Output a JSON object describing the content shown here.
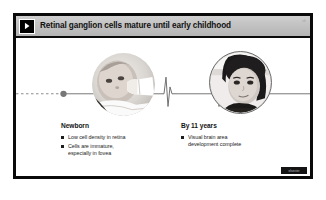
{
  "slide": {
    "header": {
      "icon": "play-chevron-icon",
      "title": "Retinal ganglion cells mature until early childhood",
      "corner_code": "ch"
    },
    "photos": [
      {
        "name": "newborn-photo",
        "alt": "Newborn baby feeding from a bottle"
      },
      {
        "name": "child-photo",
        "alt": "Young child portrait"
      }
    ],
    "timeline": {
      "left_marker": "timeline-dot-newborn",
      "right_marker": "timeline-dot-child",
      "spike_left": "timeline-spike-left",
      "spike_right": "timeline-spike-right"
    },
    "blocks": [
      {
        "heading": "Newborn",
        "bullets": [
          "Low cell density in retina",
          "Cells are immature,\nespecially in fovea"
        ]
      },
      {
        "heading": "By 11 years",
        "bullets": [
          "Visual brain area\ndevelopment complete"
        ]
      }
    ],
    "footer_badge": "elsevier"
  },
  "colors": {
    "frame": "#0a0a0a",
    "header_bg": "#c2c2c2",
    "text": "#1d1d1d",
    "timeline": "#6f6f6f"
  }
}
